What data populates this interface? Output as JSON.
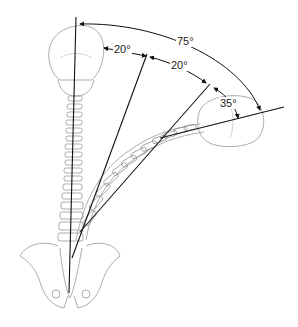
{
  "figure": {
    "angles": [
      {
        "id": "lumbar",
        "label": "20°"
      },
      {
        "id": "thoracic",
        "label": "20°"
      },
      {
        "id": "cervical",
        "label": "35°"
      },
      {
        "id": "total",
        "label": "75°"
      }
    ]
  }
}
